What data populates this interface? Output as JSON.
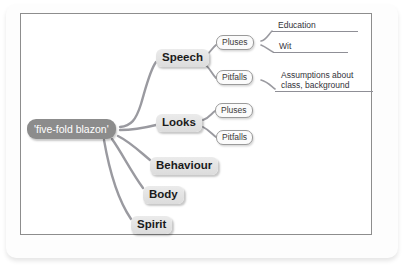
{
  "diagram": {
    "type": "mind-map",
    "root": {
      "label": "'five-fold blazon'"
    },
    "branches": [
      {
        "label": "Speech",
        "children": [
          {
            "label": "Pluses",
            "children": [
              {
                "label": "Education"
              },
              {
                "label": "Wit"
              }
            ]
          },
          {
            "label": "Pitfalls",
            "children": [
              {
                "label": "Assumptions about",
                "label_line2": "class, background"
              }
            ]
          }
        ]
      },
      {
        "label": "Looks",
        "children": [
          {
            "label": "Pluses",
            "children": []
          },
          {
            "label": "Pitfalls",
            "children": []
          }
        ]
      },
      {
        "label": "Behaviour",
        "children": []
      },
      {
        "label": "Body",
        "children": []
      },
      {
        "label": "Spirit",
        "children": []
      }
    ]
  },
  "colors": {
    "root_fill": "#8c8c8c",
    "root_text": "#ffffff",
    "branch_fill": "#e3e3e3",
    "branch_text": "#1b1b1b",
    "leaf_box_fill": "#fbfbfb",
    "connector": "#9a9aa0",
    "frame_border": "#8d8d8d",
    "page_background": "#ffffff"
  }
}
